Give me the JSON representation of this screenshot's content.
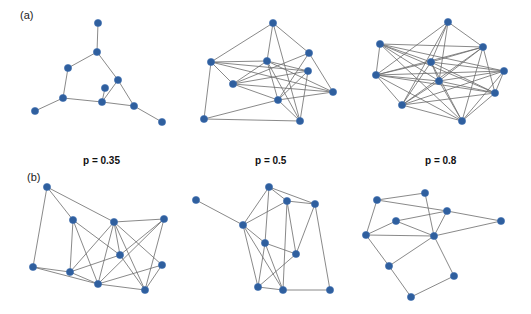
{
  "panels": {
    "a_label": "(a)",
    "b_label": "(b)"
  },
  "probability_labels": [
    "p = 0.35",
    "p = 0.5",
    "p = 0.8"
  ],
  "colors": {
    "node": "#2f5f9e",
    "edge": "#6b6b6b"
  },
  "graphs": [
    {
      "id": "a-p035",
      "row": "a",
      "p": 0.35,
      "nodes": [
        [
          98,
          23
        ],
        [
          97,
          52
        ],
        [
          68,
          68
        ],
        [
          118,
          80
        ],
        [
          105,
          88
        ],
        [
          63,
          98
        ],
        [
          102,
          102
        ],
        [
          134,
          106
        ],
        [
          35,
          111
        ],
        [
          162,
          122
        ]
      ],
      "edges": [
        [
          0,
          1
        ],
        [
          1,
          2
        ],
        [
          1,
          3
        ],
        [
          2,
          5
        ],
        [
          5,
          8
        ],
        [
          5,
          6
        ],
        [
          6,
          4
        ],
        [
          6,
          3
        ],
        [
          3,
          7
        ],
        [
          6,
          7
        ],
        [
          7,
          9
        ]
      ]
    },
    {
      "id": "a-p05",
      "row": "a",
      "p": 0.5,
      "nodes": [
        [
          273,
          23
        ],
        [
          211,
          62
        ],
        [
          267,
          61
        ],
        [
          309,
          53
        ],
        [
          308,
          71
        ],
        [
          233,
          84
        ],
        [
          333,
          92
        ],
        [
          278,
          100
        ],
        [
          204,
          119
        ],
        [
          300,
          121
        ]
      ],
      "edges": [
        [
          0,
          1
        ],
        [
          0,
          2
        ],
        [
          0,
          3
        ],
        [
          0,
          9
        ],
        [
          1,
          2
        ],
        [
          1,
          5
        ],
        [
          1,
          8
        ],
        [
          1,
          4
        ],
        [
          1,
          6
        ],
        [
          2,
          4
        ],
        [
          2,
          7
        ],
        [
          2,
          9
        ],
        [
          2,
          5
        ],
        [
          3,
          5
        ],
        [
          3,
          7
        ],
        [
          3,
          6
        ],
        [
          4,
          5
        ],
        [
          4,
          7
        ],
        [
          4,
          9
        ],
        [
          5,
          6
        ],
        [
          5,
          7
        ],
        [
          6,
          7
        ],
        [
          7,
          8
        ],
        [
          7,
          9
        ],
        [
          8,
          9
        ],
        [
          2,
          6
        ]
      ]
    },
    {
      "id": "a-p08",
      "row": "a",
      "p": 0.8,
      "nodes": [
        [
          448,
          22
        ],
        [
          380,
          44
        ],
        [
          483,
          47
        ],
        [
          431,
          62
        ],
        [
          376,
          75
        ],
        [
          504,
          71
        ],
        [
          439,
          81
        ],
        [
          495,
          93
        ],
        [
          402,
          105
        ],
        [
          462,
          121
        ]
      ],
      "edges": [
        [
          0,
          2
        ],
        [
          0,
          3
        ],
        [
          0,
          6
        ],
        [
          0,
          8
        ],
        [
          0,
          4
        ],
        [
          1,
          2
        ],
        [
          1,
          3
        ],
        [
          1,
          4
        ],
        [
          1,
          5
        ],
        [
          1,
          6
        ],
        [
          1,
          7
        ],
        [
          1,
          9
        ],
        [
          2,
          3
        ],
        [
          2,
          4
        ],
        [
          2,
          6
        ],
        [
          2,
          7
        ],
        [
          2,
          8
        ],
        [
          2,
          9
        ],
        [
          3,
          4
        ],
        [
          3,
          5
        ],
        [
          3,
          6
        ],
        [
          3,
          7
        ],
        [
          3,
          8
        ],
        [
          3,
          9
        ],
        [
          4,
          5
        ],
        [
          4,
          6
        ],
        [
          4,
          7
        ],
        [
          4,
          8
        ],
        [
          5,
          6
        ],
        [
          5,
          7
        ],
        [
          5,
          8
        ],
        [
          5,
          9
        ],
        [
          6,
          7
        ],
        [
          6,
          8
        ],
        [
          6,
          9
        ],
        [
          7,
          8
        ],
        [
          7,
          9
        ],
        [
          8,
          9
        ],
        [
          4,
          9
        ]
      ]
    },
    {
      "id": "b-p035",
      "row": "b",
      "p": 0.35,
      "nodes": [
        [
          47,
          187
        ],
        [
          73,
          220
        ],
        [
          114,
          222
        ],
        [
          164,
          219
        ],
        [
          120,
          255
        ],
        [
          162,
          265
        ],
        [
          33,
          267
        ],
        [
          70,
          272
        ],
        [
          98,
          284
        ],
        [
          145,
          290
        ]
      ],
      "edges": [
        [
          0,
          2
        ],
        [
          0,
          1
        ],
        [
          0,
          6
        ],
        [
          1,
          4
        ],
        [
          1,
          7
        ],
        [
          1,
          8
        ],
        [
          2,
          3
        ],
        [
          2,
          7
        ],
        [
          2,
          8
        ],
        [
          2,
          4
        ],
        [
          2,
          9
        ],
        [
          2,
          5
        ],
        [
          3,
          8
        ],
        [
          3,
          9
        ],
        [
          3,
          4
        ],
        [
          4,
          7
        ],
        [
          4,
          9
        ],
        [
          5,
          8
        ],
        [
          5,
          9
        ],
        [
          6,
          7
        ],
        [
          6,
          8
        ],
        [
          7,
          8
        ],
        [
          8,
          9
        ]
      ]
    },
    {
      "id": "b-p05",
      "row": "b",
      "p": 0.5,
      "nodes": [
        [
          196,
          200
        ],
        [
          269,
          187
        ],
        [
          287,
          201
        ],
        [
          315,
          204
        ],
        [
          243,
          225
        ],
        [
          265,
          243
        ],
        [
          296,
          254
        ],
        [
          258,
          287
        ],
        [
          283,
          290
        ],
        [
          330,
          290
        ]
      ],
      "edges": [
        [
          0,
          4
        ],
        [
          1,
          2
        ],
        [
          1,
          3
        ],
        [
          1,
          4
        ],
        [
          1,
          5
        ],
        [
          2,
          3
        ],
        [
          2,
          4
        ],
        [
          2,
          6
        ],
        [
          2,
          8
        ],
        [
          3,
          6
        ],
        [
          3,
          9
        ],
        [
          4,
          5
        ],
        [
          4,
          7
        ],
        [
          4,
          8
        ],
        [
          5,
          6
        ],
        [
          5,
          7
        ],
        [
          5,
          8
        ],
        [
          6,
          7
        ],
        [
          7,
          8
        ],
        [
          8,
          9
        ]
      ]
    },
    {
      "id": "b-p08",
      "row": "b",
      "p": 0.8,
      "nodes": [
        [
          377,
          200
        ],
        [
          425,
          193
        ],
        [
          396,
          221
        ],
        [
          447,
          211
        ],
        [
          366,
          235
        ],
        [
          434,
          236
        ],
        [
          501,
          221
        ],
        [
          389,
          266
        ],
        [
          454,
          276
        ],
        [
          411,
          297
        ]
      ],
      "edges": [
        [
          0,
          1
        ],
        [
          0,
          3
        ],
        [
          0,
          4
        ],
        [
          1,
          5
        ],
        [
          2,
          3
        ],
        [
          2,
          4
        ],
        [
          2,
          5
        ],
        [
          3,
          5
        ],
        [
          3,
          6
        ],
        [
          4,
          5
        ],
        [
          4,
          7
        ],
        [
          5,
          6
        ],
        [
          5,
          7
        ],
        [
          5,
          8
        ],
        [
          7,
          9
        ],
        [
          8,
          9
        ]
      ]
    }
  ]
}
